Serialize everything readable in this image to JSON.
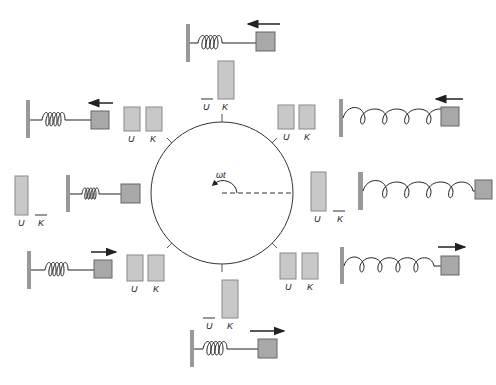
{
  "colors": {
    "bar_fill": "#c8c8c8",
    "bar_stroke": "#8a8a8a",
    "wall": "#999999",
    "block": "#a8a8a8",
    "line": "#222222"
  },
  "center": {
    "angle_label": "ωt"
  },
  "labels": {
    "potential": "U",
    "kinetic": "K"
  },
  "states": [
    {
      "id": "top",
      "position": "equilibrium",
      "velocity_arrow": "left",
      "U_height": 0,
      "K_height": 36
    },
    {
      "id": "upper-left",
      "position": "compressed-half",
      "velocity_arrow": "left",
      "U_height": 24,
      "K_height": 24
    },
    {
      "id": "left",
      "position": "max-compressed",
      "velocity_arrow": "none",
      "U_height": 40,
      "K_height": 0
    },
    {
      "id": "lower-left",
      "position": "compressed-half",
      "velocity_arrow": "right",
      "U_height": 26,
      "K_height": 26
    },
    {
      "id": "bottom",
      "position": "equilibrium",
      "velocity_arrow": "right",
      "U_height": 0,
      "K_height": 38
    },
    {
      "id": "lower-right",
      "position": "stretched-half",
      "velocity_arrow": "right",
      "U_height": 26,
      "K_height": 26
    },
    {
      "id": "right",
      "position": "max-stretched",
      "velocity_arrow": "none",
      "U_height": 40,
      "K_height": 0
    },
    {
      "id": "upper-right",
      "position": "stretched-half",
      "velocity_arrow": "left",
      "U_height": 24,
      "K_height": 24
    }
  ]
}
